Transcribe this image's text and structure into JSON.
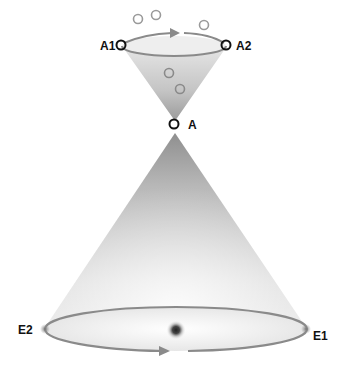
{
  "diagram": {
    "type": "cone-diagram",
    "labels": {
      "a1": "A1",
      "a2": "A2",
      "a": "A",
      "e1": "E1",
      "e2": "E2"
    },
    "colors": {
      "arrow": "#8a8a8a",
      "outline": "#111111",
      "cone_dark": "#9a9a9a",
      "cone_light": "#ffffff",
      "center_dot": "#222222"
    },
    "top_funnel": {
      "rim_points": [
        "A1",
        "A2"
      ],
      "apex": "A",
      "arrow_direction": "left-to-right (clockwise on top rim)",
      "floating_circles": 5
    },
    "bottom_cone": {
      "base_points": [
        "E2",
        "E1"
      ],
      "arrow_direction": "left-to-right along front of base",
      "center_marker": "dark dot"
    }
  }
}
